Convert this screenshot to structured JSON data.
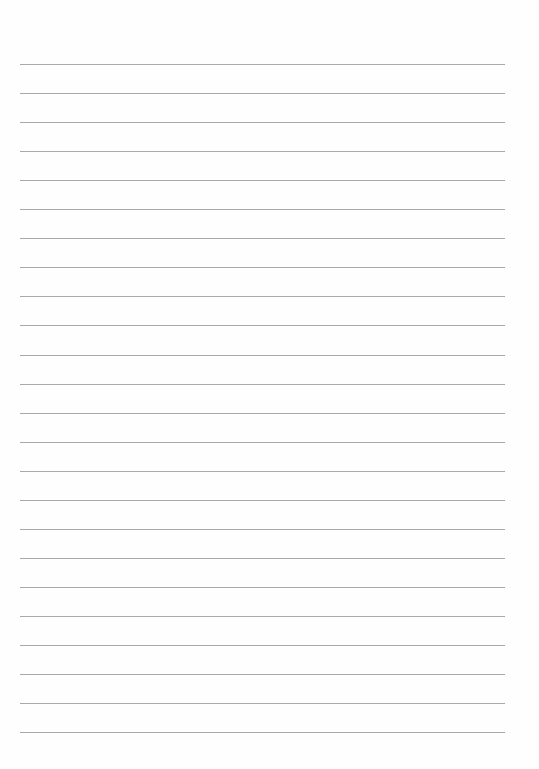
{
  "page": {
    "type": "lined-paper",
    "background": "#fefefe",
    "line_color": "#9a9a9a",
    "line_count": 24,
    "first_line_y": 64,
    "line_spacing": 29.05,
    "line_left": 20,
    "line_width": 485,
    "text": []
  }
}
